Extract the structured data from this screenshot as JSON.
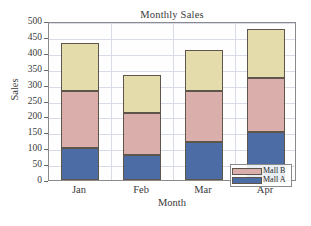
{
  "chart_data": {
    "type": "bar",
    "subtype": "stacked-bar",
    "title": "Monthly Sales",
    "xlabel": "Month",
    "ylabel": "Sales",
    "categories": [
      "Jan",
      "Feb",
      "Mar",
      "Apr"
    ],
    "ylim": [
      0,
      500
    ],
    "yticks": [
      0,
      50,
      100,
      150,
      200,
      250,
      300,
      350,
      400,
      450,
      500
    ],
    "ytick_labels": [
      "0",
      "50",
      "100",
      "150",
      "200",
      "250",
      "300",
      "350",
      "400",
      "450",
      "500"
    ],
    "grid": true,
    "legend_position": "bottom-right",
    "series": [
      {
        "name": "Mall A",
        "color": "#4c6ca5",
        "values": [
          100,
          80,
          120,
          150
        ],
        "in_legend": true
      },
      {
        "name": "Mall B",
        "color": "#d9aeab",
        "values": [
          180,
          130,
          160,
          170
        ],
        "in_legend": true
      },
      {
        "name": "",
        "color": "#e4dcab",
        "values": [
          150,
          120,
          130,
          155
        ],
        "in_legend": false
      }
    ],
    "cumulative_tops": [
      [
        100,
        280,
        430
      ],
      [
        80,
        210,
        330
      ],
      [
        120,
        280,
        410
      ],
      [
        150,
        320,
        475
      ]
    ],
    "totals": [
      430,
      330,
      410,
      475
    ],
    "legend_entries": [
      {
        "label": "Mall B",
        "color": "#d9aeab"
      },
      {
        "label": "Mall A",
        "color": "#4c6ca5"
      }
    ],
    "colors": {
      "series_a": "#4c6ca5",
      "series_b": "#d9aeab",
      "series_c": "#e4dcab",
      "grid": "#d8dce8",
      "frame": "#8a8a8a",
      "text": "#3a3a3a",
      "background": "#ffffff"
    }
  }
}
